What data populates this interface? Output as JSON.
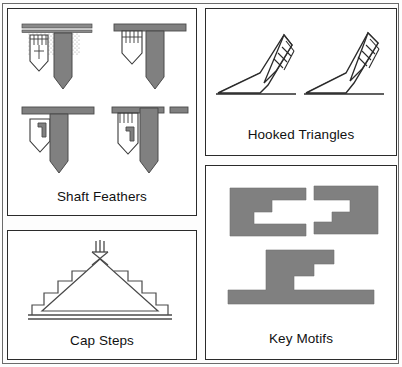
{
  "figure": {
    "background_color": "#ffffff",
    "frame_color": "#6b6b6b",
    "motif_fill": "#808080",
    "motif_outline": "#333333",
    "label_color": "#111111"
  },
  "panels": [
    {
      "id": "shaft-feathers",
      "label": "Shaft Feathers",
      "motif_count": 4,
      "motifs": [
        {
          "name": "shaft-feather-stippled",
          "description": "banner line with stippled field, barbed feather and solid shaft"
        },
        {
          "name": "shaft-feather-barbed",
          "description": "solid banner, barbed feather with solid shaft"
        },
        {
          "name": "shaft-feather-hooked",
          "description": "solid banner, hooked key feather with solid shaft"
        },
        {
          "name": "shaft-feather-barbed-hooked",
          "description": "split banner, barbed and hooked feather with solid shaft"
        }
      ]
    },
    {
      "id": "hooked-triangles",
      "label": "Hooked Triangles",
      "motif_count": 2,
      "motifs": [
        {
          "name": "hooked-triangle-left",
          "description": "solid triangle on baseline with outlined hooked tail and comb barbs"
        },
        {
          "name": "hooked-triangle-right",
          "description": "solid triangle on baseline with outlined hooked tail and comb barbs"
        }
      ]
    },
    {
      "id": "cap-steps",
      "label": "Cap Steps",
      "motif_count": 1,
      "motifs": [
        {
          "name": "cap-step-triangle",
          "description": "outlined triangle with stepped flanks, crossed apex and plume on double baseline"
        }
      ]
    },
    {
      "id": "key-motifs",
      "label": "Key Motifs",
      "motif_count": 3,
      "motifs": [
        {
          "name": "key-motif-upper-left",
          "description": "solid block with stepped negative staircase opening right"
        },
        {
          "name": "key-motif-upper-right",
          "description": "solid block with stepped negative staircase opening left"
        },
        {
          "name": "key-motif-lower",
          "description": "stepped solid key form rising from a long horizontal base bar"
        }
      ]
    }
  ]
}
